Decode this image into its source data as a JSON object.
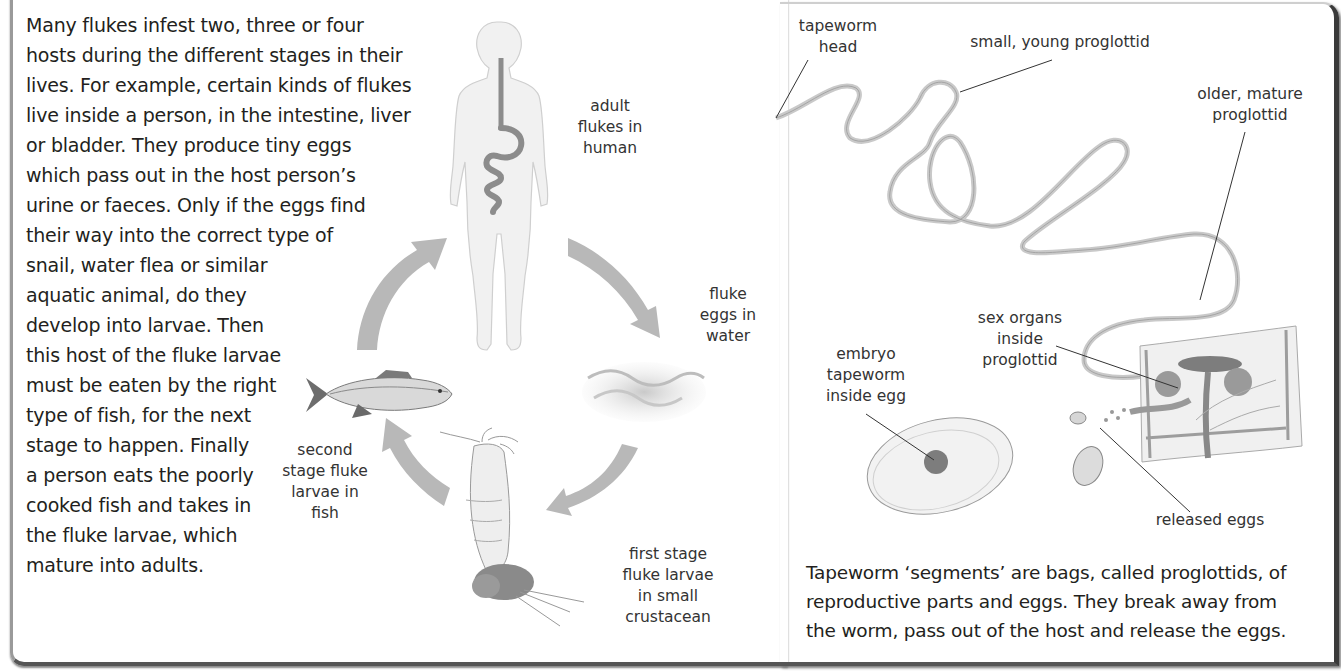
{
  "fluke_section": {
    "intro_lines": [
      "Many flukes infest two, three or four",
      "hosts during the different stages in their",
      "lives. For example, certain kinds of flukes",
      "live inside a person, in the intestine, liver",
      "or bladder. They produce tiny eggs",
      "which pass out in the host person’s",
      "urine or faeces. Only if the eggs find",
      "their way into the correct type of",
      "snail, water flea or similar",
      "aquatic animal, do they",
      "develop into larvae. Then",
      "this host of the fluke larvae",
      "must be eaten by the right",
      "type of fish, for the next",
      "stage to happen. Finally",
      "a person eats the poorly",
      "cooked fish and takes in",
      "the fluke larvae, which",
      "mature into adults."
    ],
    "cycle": {
      "stages": [
        {
          "id": "human",
          "label_lines": [
            "adult",
            "flukes in",
            "human"
          ],
          "icon": "human-body-icon"
        },
        {
          "id": "water",
          "label_lines": [
            "fluke",
            "eggs in",
            "water"
          ],
          "icon": "water-waves-icon"
        },
        {
          "id": "crustacean",
          "label_lines": [
            "first stage",
            "fluke larvae",
            "in small",
            "crustacean"
          ],
          "icon": "crustacean-icon"
        },
        {
          "id": "fish",
          "label_lines": [
            "second",
            "stage fluke",
            "larvae in",
            "fish"
          ],
          "icon": "fish-icon"
        }
      ],
      "arrow_color": "#b5b5b5"
    }
  },
  "tapeworm_section": {
    "labels": {
      "head": [
        "tapeworm",
        "head"
      ],
      "young": [
        "small, young proglottid"
      ],
      "mature": [
        "older, mature",
        "proglottid"
      ],
      "sex_organs": [
        "sex organs",
        "inside",
        "proglottid"
      ],
      "embryo": [
        "embryo",
        "tapeworm",
        "inside egg"
      ],
      "released": [
        "released eggs"
      ]
    },
    "caption_lines": [
      "Tapeworm ‘segments’ are bags, called proglottids, of",
      "reproductive parts and eggs. They break away from",
      "the worm, pass out of the host and release the eggs."
    ]
  }
}
